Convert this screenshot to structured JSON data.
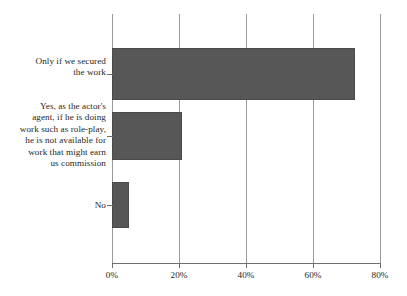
{
  "chart_data": {
    "type": "bar",
    "orientation": "horizontal",
    "title": "",
    "subtitle": "",
    "xlabel": "",
    "ylabel": "",
    "categories": [
      "Only if we secured the work",
      "Yes, as the actor's agent, if he is doing work such as role-play, he is not available for work that might earn us commission",
      "No"
    ],
    "category_lines": [
      [
        "Only if we secured",
        "the work"
      ],
      [
        "Yes, as the actor's",
        "agent, if he is doing",
        "work such as role-play,",
        "he is not available for",
        "work that might earn",
        "us commission"
      ],
      [
        "No"
      ]
    ],
    "values": [
      72.5,
      21,
      5
    ],
    "value_unit": "%",
    "xlim": [
      0,
      80
    ],
    "xticks": [
      0,
      20,
      40,
      60,
      80
    ],
    "xtick_labels": [
      "0%",
      "20%",
      "40%",
      "60%",
      "80%"
    ],
    "grid": true,
    "grid_axis": "x",
    "legend": false,
    "legend_position": "none",
    "series": [
      {
        "name": "Response share",
        "values": [
          72.5,
          21,
          5
        ]
      }
    ]
  },
  "style": {
    "bar_color": "#575757",
    "bar_border_color": "#4a4a4a",
    "gridline_color": "#9a9a9a",
    "axis_color": "#6f6f6f",
    "background_color": "#ffffff",
    "text_color": "#1f1f1f"
  }
}
